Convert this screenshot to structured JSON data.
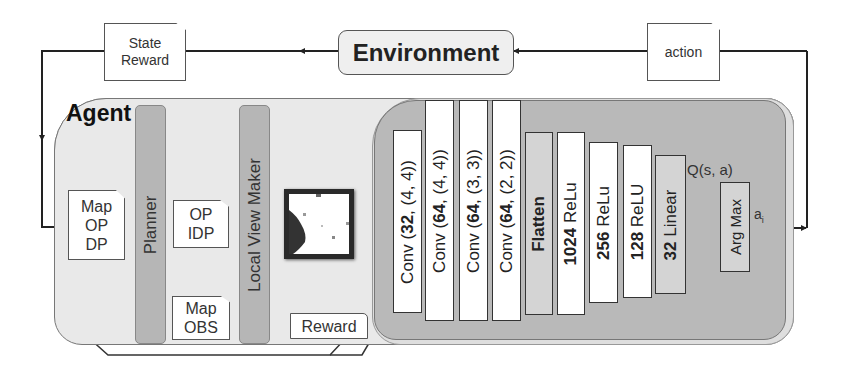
{
  "environment": {
    "label": "Environment"
  },
  "notes": {
    "state_reward": {
      "line1": "State",
      "line2": "Reward"
    },
    "action": {
      "label": "action"
    },
    "map_op_dp": {
      "line1": "Map",
      "line2": "OP",
      "line3": "DP"
    },
    "op_idp": {
      "line1": "OP",
      "line2": "IDP"
    },
    "map_obs": {
      "line1": "Map",
      "line2": "OBS"
    },
    "reward": {
      "label": "Reward"
    }
  },
  "agent": {
    "title": "Agent",
    "planner": {
      "label": "Planner"
    },
    "local_view_maker": {
      "label": "Local View Maker"
    },
    "local_view_image": {
      "description": "local-view-map"
    }
  },
  "network": {
    "layers": [
      {
        "prefix": "Conv (",
        "num": "32",
        "suffix": ", (4, 4))"
      },
      {
        "prefix": "Conv (",
        "num": "64",
        "suffix": ", (4, 4))"
      },
      {
        "prefix": "Conv (",
        "num": "64",
        "suffix": ", (3, 3))"
      },
      {
        "prefix": "Conv (",
        "num": "64",
        "suffix": ", (2, 2))"
      },
      {
        "label": "Flatten"
      },
      {
        "num": "1024",
        "suffix": " ReLu"
      },
      {
        "num": "256",
        "suffix": " ReLu"
      },
      {
        "num": "128",
        "suffix": " ReLU"
      },
      {
        "num": "32",
        "suffix": " Linear"
      }
    ],
    "q_label": "Q(s, a)",
    "argmax": {
      "label": "Arg Max"
    },
    "output_label": "a",
    "output_subscript": "i"
  },
  "colors": {
    "agent_bg": "#e9e9e9",
    "network_bg": "#b9b9b9",
    "pillar_bg": "#b6b6b6",
    "line": "#222222"
  }
}
